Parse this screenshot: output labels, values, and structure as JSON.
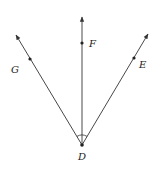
{
  "diagram": {
    "colors": {
      "stroke": "#333333",
      "background": "#ffffff"
    },
    "vertex": {
      "label": "D",
      "x": 82,
      "y": 145,
      "label_x": 82,
      "label_y": 160
    },
    "rays": [
      {
        "name": "ray-DG",
        "point_label": "G",
        "tip_x": 16,
        "tip_y": 35,
        "point_x": 30,
        "point_y": 59,
        "label_x": 11,
        "label_y": 73
      },
      {
        "name": "ray-DF",
        "point_label": "F",
        "tip_x": 82,
        "tip_y": 17,
        "point_x": 82,
        "point_y": 43,
        "label_x": 89,
        "label_y": 47
      },
      {
        "name": "ray-DE",
        "point_label": "E",
        "tip_x": 148,
        "tip_y": 34,
        "point_x": 134,
        "point_y": 58,
        "label_x": 140,
        "label_y": 68
      }
    ],
    "angle_arc": {
      "radius": 10
    }
  }
}
